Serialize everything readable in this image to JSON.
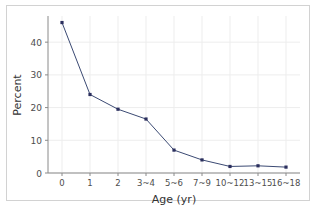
{
  "chart_data": {
    "type": "line",
    "title": "",
    "xlabel": "Age (yr)",
    "ylabel": "Percent",
    "categories": [
      "0",
      "1",
      "2",
      "3~4",
      "5~6",
      "7~9",
      "10~12",
      "13~15",
      "16~18"
    ],
    "values": [
      46,
      24,
      19.5,
      16.5,
      7,
      4,
      2,
      2.2,
      1.8
    ],
    "series": [
      {
        "name": "Percent",
        "values": [
          46,
          24,
          19.5,
          16.5,
          7,
          4,
          2,
          2.2,
          1.8
        ]
      }
    ],
    "ylim": [
      0,
      48
    ],
    "yticks": [
      0,
      10,
      20,
      30,
      40
    ],
    "ytick_labels": [
      "0",
      "10",
      "20",
      "30",
      "40"
    ],
    "xtick_labels": [
      "0",
      "1",
      "2",
      "3~4",
      "5~6",
      "7~9",
      "10~12",
      "13~15",
      "16~18"
    ],
    "grid": true,
    "legend": false,
    "legend_position": "none",
    "marker": "square",
    "line_color": "#3b4a73",
    "marker_color": "#2b2f5e",
    "grid_color": "#ededed",
    "axis_color": "#8a8a8a",
    "tick_label_color": "#4d4d4d",
    "axis_label_color": "#333333",
    "border_color": "#d2d2d2",
    "background_color": "#ffffff"
  }
}
